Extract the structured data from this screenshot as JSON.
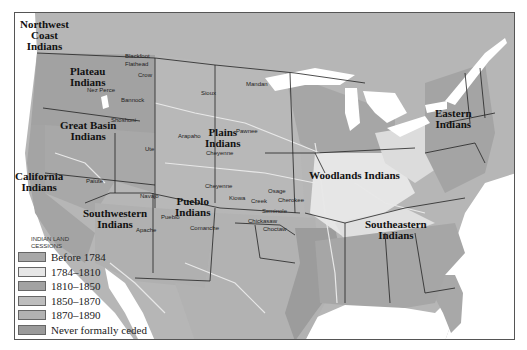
{
  "map": {
    "colors": {
      "background": "#ffffff",
      "canada": "#b4b4b4",
      "before_1784": "#a8a8a8",
      "1784_1810": "#e6e6e6",
      "1810_1850": "#a2a2a2",
      "1850_1870": "#bdbdbd",
      "1870_1890": "#b2b2b2",
      "never_ceded": "#9a9a9a",
      "water": "#ffffff",
      "rivers": "#e8e8e8",
      "borders": "#222222"
    },
    "region_labels": [
      {
        "id": "northwest-coast",
        "text": "Northwest\nCoast\nIndians"
      },
      {
        "id": "plateau",
        "text": "Plateau\nIndians"
      },
      {
        "id": "great-basin",
        "text": "Great Basin\nIndians"
      },
      {
        "id": "california",
        "text": "California\nIndians"
      },
      {
        "id": "southwestern",
        "text": "Southwestern\nIndians"
      },
      {
        "id": "pueblo",
        "text": "Pueblo\nIndians"
      },
      {
        "id": "plains",
        "text": "Plains\nIndians"
      },
      {
        "id": "woodlands",
        "text": "Woodlands Indians"
      },
      {
        "id": "eastern",
        "text": "Eastern\nIndians"
      },
      {
        "id": "southeastern",
        "text": "Southeastern\nIndians"
      }
    ],
    "tribe_labels": [
      "Blackfoot",
      "Flathead",
      "Crow",
      "Nez Perce",
      "Bannock",
      "Shoshoni",
      "Sioux",
      "Mandan",
      "Pawnee",
      "Arapaho",
      "Ute",
      "Cheyenne",
      "Cheyenne",
      "Paiute",
      "Navajo",
      "Apache",
      "Pueblo",
      "Comanche",
      "Kiowa",
      "Osage",
      "Creek",
      "Cherokee",
      "Seminole",
      "Chickasaw",
      "Choctaw"
    ]
  },
  "legend": {
    "title": "INDIAN LAND CESSIONS",
    "items": [
      {
        "label": "Before 1784",
        "color": "#a8a8a8"
      },
      {
        "label": "1784–1810",
        "color": "#e6e6e6"
      },
      {
        "label": "1810–1850",
        "color": "#a2a2a2"
      },
      {
        "label": "1850–1870",
        "color": "#bdbdbd"
      },
      {
        "label": "1870–1890",
        "color": "#b2b2b2"
      },
      {
        "label": "Never formally ceded",
        "color": "#9a9a9a"
      }
    ]
  }
}
